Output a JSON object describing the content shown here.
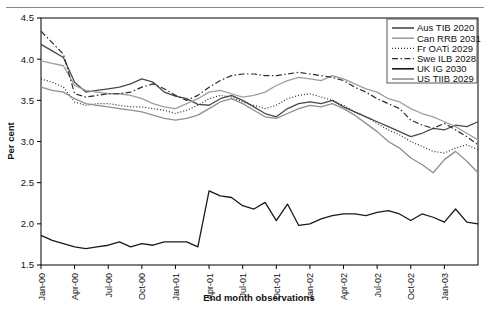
{
  "figure": {
    "ylabel": "Per cent",
    "xlabel": "End month observations",
    "yticks": [
      "1.5",
      "2.0",
      "2.5",
      "3.0",
      "3.5",
      "4.0",
      "4.5"
    ],
    "xticks": [
      "Jan-00",
      "Apr-00",
      "Jul-00",
      "Oct-00",
      "Jan-01",
      "Apr-01",
      "Jul-01",
      "Oct-01",
      "Jan-02",
      "Apr-02",
      "Jul-02",
      "Oct-02",
      "Jan-03"
    ]
  },
  "legend": {
    "items": [
      {
        "label": "Aus TIB 2020",
        "style": "solid",
        "color": "#4a4a4a"
      },
      {
        "label": "Can RRB 2031",
        "style": "solid",
        "color": "#9e9e9e"
      },
      {
        "label": "Fr OATi 2029",
        "style": "dotted",
        "color": "#2b2b2b"
      },
      {
        "label": "Swe ILB 2028",
        "style": "dashdot",
        "color": "#2b2b2b"
      },
      {
        "label": "UK IG 2030",
        "style": "solid",
        "color": "#1a1a1a"
      },
      {
        "label": "US TIIB 2029",
        "style": "solid",
        "color": "#8f8f8f"
      }
    ]
  },
  "chart_data": {
    "type": "line",
    "title": "",
    "xlabel": "End month observations",
    "ylabel": "Per cent",
    "ylim": [
      1.5,
      4.5
    ],
    "grid": false,
    "legend_position": "top-right",
    "x": [
      "Jan-00",
      "Feb-00",
      "Mar-00",
      "Apr-00",
      "May-00",
      "Jun-00",
      "Jul-00",
      "Aug-00",
      "Sep-00",
      "Oct-00",
      "Nov-00",
      "Dec-00",
      "Jan-01",
      "Feb-01",
      "Mar-01",
      "Apr-01",
      "May-01",
      "Jun-01",
      "Jul-01",
      "Aug-01",
      "Sep-01",
      "Oct-01",
      "Nov-01",
      "Dec-01",
      "Jan-02",
      "Feb-02",
      "Mar-02",
      "Apr-02",
      "May-02",
      "Jun-02",
      "Jul-02",
      "Aug-02",
      "Sep-02",
      "Oct-02",
      "Nov-02",
      "Dec-02",
      "Jan-03",
      "Feb-03",
      "Mar-03",
      "Apr-03"
    ],
    "series": [
      {
        "name": "Aus TIB 2020",
        "style": "solid",
        "color": "#4a4a4a",
        "values": [
          4.18,
          4.1,
          4.02,
          3.72,
          3.6,
          3.62,
          3.64,
          3.66,
          3.7,
          3.76,
          3.72,
          3.6,
          3.55,
          3.52,
          3.45,
          3.44,
          3.52,
          3.56,
          3.5,
          3.42,
          3.34,
          3.3,
          3.4,
          3.46,
          3.48,
          3.46,
          3.5,
          3.42,
          3.36,
          3.3,
          3.24,
          3.18,
          3.12,
          3.06,
          3.1,
          3.16,
          3.14,
          3.2,
          3.18,
          3.24
        ]
      },
      {
        "name": "Can RRB 2031",
        "style": "solid",
        "color": "#9e9e9e",
        "values": [
          3.98,
          3.95,
          3.92,
          3.68,
          3.62,
          3.6,
          3.58,
          3.58,
          3.56,
          3.52,
          3.46,
          3.42,
          3.4,
          3.46,
          3.52,
          3.6,
          3.62,
          3.58,
          3.54,
          3.56,
          3.6,
          3.68,
          3.74,
          3.78,
          3.76,
          3.74,
          3.8,
          3.76,
          3.7,
          3.64,
          3.6,
          3.52,
          3.48,
          3.4,
          3.34,
          3.3,
          3.24,
          3.18,
          3.1,
          3.02
        ]
      },
      {
        "name": "Fr OATi 2029",
        "style": "dotted",
        "color": "#2b2b2b",
        "values": [
          3.76,
          3.72,
          3.66,
          3.48,
          3.44,
          3.46,
          3.46,
          3.44,
          3.42,
          3.42,
          3.4,
          3.38,
          3.34,
          3.38,
          3.44,
          3.52,
          3.56,
          3.54,
          3.48,
          3.44,
          3.4,
          3.44,
          3.52,
          3.56,
          3.58,
          3.54,
          3.5,
          3.44,
          3.36,
          3.3,
          3.22,
          3.14,
          3.08,
          3.0,
          2.94,
          2.88,
          2.86,
          2.92,
          2.96,
          2.9
        ]
      },
      {
        "name": "Swe ILB 2028",
        "style": "dashdot",
        "color": "#2b2b2b",
        "values": [
          4.34,
          4.2,
          4.06,
          3.58,
          3.54,
          3.56,
          3.58,
          3.58,
          3.6,
          3.66,
          3.7,
          3.64,
          3.56,
          3.5,
          3.56,
          3.66,
          3.74,
          3.8,
          3.82,
          3.82,
          3.8,
          3.8,
          3.82,
          3.84,
          3.82,
          3.8,
          3.78,
          3.74,
          3.66,
          3.6,
          3.52,
          3.46,
          3.4,
          3.26,
          3.2,
          3.16,
          3.22,
          3.14,
          3.06,
          2.96
        ]
      },
      {
        "name": "UK IG 2030",
        "style": "solid",
        "color": "#1a1a1a",
        "values": [
          1.86,
          1.8,
          1.76,
          1.72,
          1.7,
          1.72,
          1.74,
          1.78,
          1.72,
          1.76,
          1.74,
          1.78,
          1.78,
          1.78,
          1.72,
          2.4,
          2.34,
          2.32,
          2.22,
          2.18,
          2.26,
          2.04,
          2.24,
          1.98,
          2.0,
          2.06,
          2.1,
          2.12,
          2.12,
          2.1,
          2.14,
          2.16,
          2.12,
          2.04,
          2.12,
          2.08,
          2.02,
          2.18,
          2.02,
          2.0
        ]
      },
      {
        "name": "US TIIB 2029",
        "style": "solid",
        "color": "#8f8f8f",
        "values": [
          3.66,
          3.62,
          3.6,
          3.52,
          3.46,
          3.44,
          3.42,
          3.4,
          3.38,
          3.36,
          3.32,
          3.28,
          3.26,
          3.28,
          3.32,
          3.4,
          3.48,
          3.52,
          3.46,
          3.38,
          3.3,
          3.28,
          3.34,
          3.4,
          3.44,
          3.42,
          3.46,
          3.4,
          3.32,
          3.22,
          3.12,
          3.0,
          2.92,
          2.8,
          2.72,
          2.62,
          2.78,
          2.88,
          2.76,
          2.62
        ]
      }
    ]
  }
}
